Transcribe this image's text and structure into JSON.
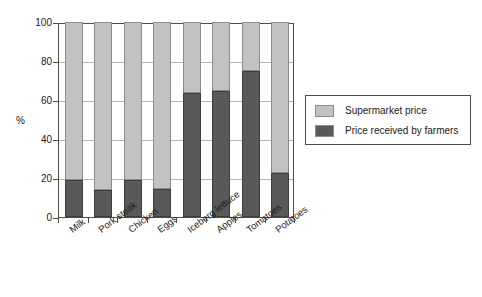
{
  "chart_data": {
    "type": "bar",
    "stacked": true,
    "title": "",
    "subtitle": "",
    "xlabel": "",
    "ylabel": "%",
    "ylim": [
      0,
      100
    ],
    "yticks": [
      0,
      20,
      40,
      60,
      80,
      100
    ],
    "ytick_labels": [
      "0",
      "20",
      "40",
      "60",
      "80",
      "100"
    ],
    "grid": true,
    "legend_position": "right",
    "categories": [
      "Milk",
      "Pork steak",
      "Chicken",
      "Eggs",
      "Iceberg lettuce",
      "Apples",
      "Tomatoes",
      "Potatoes"
    ],
    "series": [
      {
        "name": "Price received by farmers",
        "color": "#595959",
        "values": [
          19,
          14,
          19,
          14.5,
          63.5,
          64.5,
          75,
          22.5
        ]
      },
      {
        "name": "Supermarket price",
        "color": "#c2c2c2",
        "values": [
          81,
          86,
          81,
          85.5,
          36.5,
          35.5,
          25,
          77.5
        ]
      }
    ],
    "legend_order": [
      "Supermarket price",
      "Price received by farmers"
    ]
  },
  "colors": {
    "supermarket_price": "#c2c2c2",
    "farmer_price": "#595959",
    "axis": "#4d4d4d",
    "gridline": "#b4b4b4",
    "background": "#ffffff",
    "text": "#1a1a1a"
  }
}
